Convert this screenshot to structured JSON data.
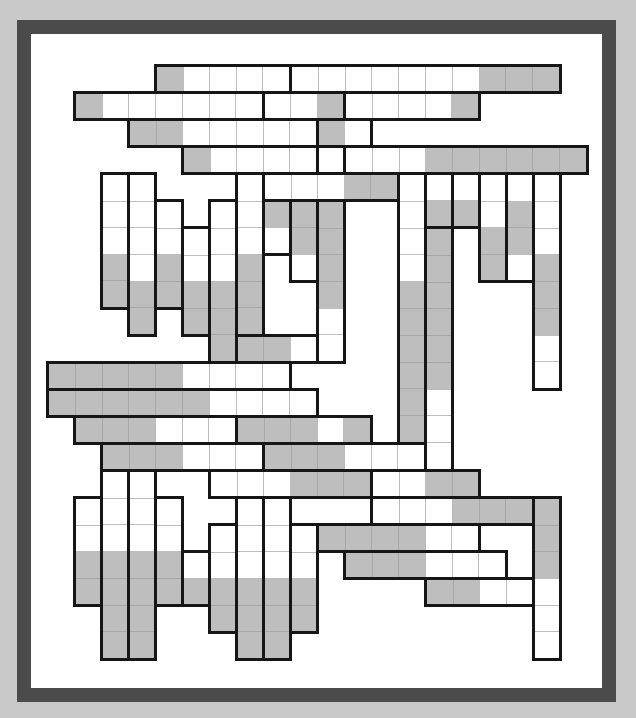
{
  "puzzle": {
    "type": "strip-grid-puzzle",
    "grid": {
      "origin_x": 47,
      "origin_y": 65,
      "cell_size": 27,
      "cols": 20,
      "rows": 22
    },
    "colors": {
      "background": "#c9c9c9",
      "frame": "#4b4b4b",
      "board": "#ffffff",
      "border": "#161616",
      "cell_white": "#ffffff",
      "cell_gray": "#bebebe"
    },
    "legend": {
      "W": "white cell",
      "G": "gray (shaded) cell"
    },
    "pieces": [
      {
        "dir": "h",
        "row": 0,
        "col": 4,
        "cells": "GWWWW"
      },
      {
        "dir": "h",
        "row": 0,
        "col": 9,
        "cells": "WWWWWWWGGG"
      },
      {
        "dir": "h",
        "row": 1,
        "col": 1,
        "cells": "GWWWWWW"
      },
      {
        "dir": "h",
        "row": 1,
        "col": 8,
        "cells": "WWG"
      },
      {
        "dir": "h",
        "row": 1,
        "col": 11,
        "cells": "WWWWG"
      },
      {
        "dir": "h",
        "row": 2,
        "col": 3,
        "cells": "GGWWWWW"
      },
      {
        "dir": "h",
        "row": 2,
        "col": 10,
        "cells": "GW"
      },
      {
        "dir": "h",
        "row": 3,
        "col": 5,
        "cells": "GWWWW"
      },
      {
        "dir": "h",
        "row": 3,
        "col": 10,
        "cells": "W"
      },
      {
        "dir": "h",
        "row": 3,
        "col": 11,
        "cells": "WWWGGGGGG"
      },
      {
        "dir": "h",
        "row": 4,
        "col": 8,
        "cells": "WWWGG"
      },
      {
        "dir": "h",
        "row": 10,
        "col": 7,
        "cells": "GGW"
      },
      {
        "dir": "h",
        "row": 11,
        "col": 0,
        "cells": "GGGGGWWWW"
      },
      {
        "dir": "h",
        "row": 12,
        "col": 0,
        "cells": "GGGGGGWWWW"
      },
      {
        "dir": "h",
        "row": 13,
        "col": 1,
        "cells": "GGGWWW"
      },
      {
        "dir": "h",
        "row": 13,
        "col": 7,
        "cells": "GGGWG"
      },
      {
        "dir": "h",
        "row": 14,
        "col": 2,
        "cells": "GGGWWW"
      },
      {
        "dir": "h",
        "row": 14,
        "col": 8,
        "cells": "GGGWWW"
      },
      {
        "dir": "h",
        "row": 15,
        "col": 6,
        "cells": "WWWGGG"
      },
      {
        "dir": "h",
        "row": 15,
        "col": 12,
        "cells": "WWGG"
      },
      {
        "dir": "h",
        "row": 16,
        "col": 12,
        "cells": "WWWGGG"
      },
      {
        "dir": "h",
        "row": 17,
        "col": 10,
        "cells": "GGGGWW"
      },
      {
        "dir": "h",
        "row": 18,
        "col": 11,
        "cells": "GGGWWW"
      },
      {
        "dir": "h",
        "row": 19,
        "col": 14,
        "cells": "GGWW"
      },
      {
        "dir": "v",
        "row": 4,
        "col": 2,
        "cells": "WWWGG"
      },
      {
        "dir": "v",
        "row": 4,
        "col": 3,
        "cells": "WWWWGG"
      },
      {
        "dir": "v",
        "row": 5,
        "col": 4,
        "cells": "WWGG"
      },
      {
        "dir": "v",
        "row": 6,
        "col": 5,
        "cells": "WWGG"
      },
      {
        "dir": "v",
        "row": 5,
        "col": 6,
        "cells": "WWWGGG"
      },
      {
        "dir": "v",
        "row": 4,
        "col": 7,
        "cells": "WWWGGG"
      },
      {
        "dir": "v",
        "row": 5,
        "col": 8,
        "cells": "GW"
      },
      {
        "dir": "v",
        "row": 5,
        "col": 9,
        "cells": "GGW"
      },
      {
        "dir": "v",
        "row": 5,
        "col": 10,
        "cells": "GGGGWW"
      },
      {
        "dir": "v",
        "row": 4,
        "col": 13,
        "cells": "WWWWGGGGGG"
      },
      {
        "dir": "v",
        "row": 4,
        "col": 14,
        "cells": "WG"
      },
      {
        "dir": "v",
        "row": 6,
        "col": 14,
        "cells": "GGGGGGWWW"
      },
      {
        "dir": "v",
        "row": 4,
        "col": 15,
        "cells": "WG"
      },
      {
        "dir": "v",
        "row": 4,
        "col": 16,
        "cells": "WWGG"
      },
      {
        "dir": "v",
        "row": 4,
        "col": 17,
        "cells": "WGGW"
      },
      {
        "dir": "v",
        "row": 4,
        "col": 18,
        "cells": "WWWGGGWW"
      },
      {
        "dir": "v",
        "row": 16,
        "col": 1,
        "cells": "WWGG"
      },
      {
        "dir": "v",
        "row": 15,
        "col": 2,
        "cells": "WWWGGGG"
      },
      {
        "dir": "v",
        "row": 15,
        "col": 3,
        "cells": "WWWGGGG"
      },
      {
        "dir": "v",
        "row": 16,
        "col": 4,
        "cells": "WWGG"
      },
      {
        "dir": "v",
        "row": 18,
        "col": 5,
        "cells": "WG"
      },
      {
        "dir": "v",
        "row": 17,
        "col": 6,
        "cells": "WWGG"
      },
      {
        "dir": "v",
        "row": 16,
        "col": 7,
        "cells": "WWWGGG"
      },
      {
        "dir": "v",
        "row": 16,
        "col": 8,
        "cells": "WWWGGG"
      },
      {
        "dir": "v",
        "row": 17,
        "col": 9,
        "cells": "WWGG"
      },
      {
        "dir": "v",
        "row": 16,
        "col": 18,
        "cells": "GGGWWW"
      }
    ]
  }
}
